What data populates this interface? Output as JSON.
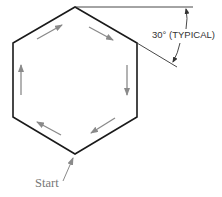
{
  "diagram": {
    "shape": "hexagon",
    "dimension_label": "30° (TYPICAL)",
    "start_label": "Start",
    "colors": {
      "outline": "#1a1a1a",
      "arrows": "#8a8a8a",
      "dimension": "#333333",
      "start_text": "#777777"
    },
    "direction": "clockwise"
  }
}
